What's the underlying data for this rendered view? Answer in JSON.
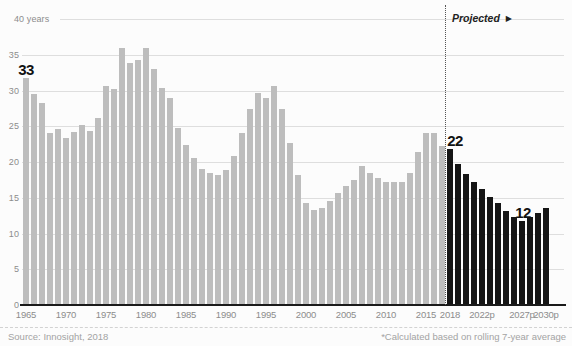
{
  "chart_data": {
    "type": "bar",
    "unit": "years",
    "start_year": 1965,
    "end_year": 2030,
    "values": [
      31.8,
      29.5,
      28.2,
      24.0,
      24.6,
      23.4,
      24.2,
      25.2,
      24.4,
      26.1,
      30.6,
      30.2,
      36.0,
      33.8,
      34.2,
      36.0,
      33.0,
      30.3,
      28.9,
      24.8,
      22.4,
      20.5,
      19.0,
      18.4,
      18.2,
      18.9,
      20.8,
      24.1,
      27.4,
      29.6,
      29.0,
      30.6,
      27.4,
      22.7,
      18.2,
      14.3,
      13.3,
      13.6,
      14.6,
      15.6,
      16.6,
      17.5,
      19.4,
      18.4,
      17.8,
      17.2,
      17.2,
      17.2,
      18.4,
      21.4,
      24.0,
      24.0,
      22.2,
      21.8,
      19.7,
      18.3,
      17.2,
      16.2,
      15.1,
      14.3,
      13.2,
      12.3,
      11.8,
      12.3,
      12.8,
      13.5
    ],
    "projected_from_year": 2018,
    "ylim": [
      0,
      40
    ],
    "yticks": [
      {
        "value": 0,
        "label": "0"
      },
      {
        "value": 5,
        "label": "5"
      },
      {
        "value": 10,
        "label": "10"
      },
      {
        "value": 15,
        "label": "15"
      },
      {
        "value": 20,
        "label": "20"
      },
      {
        "value": 25,
        "label": "25"
      },
      {
        "value": 30,
        "label": "30"
      },
      {
        "value": 35,
        "label": "35"
      },
      {
        "value": 40,
        "label": "40 years"
      }
    ],
    "xticks": [
      {
        "year": 1965,
        "label": "1965"
      },
      {
        "year": 1970,
        "label": "1970"
      },
      {
        "year": 1975,
        "label": "1975"
      },
      {
        "year": 1980,
        "label": "1980"
      },
      {
        "year": 1985,
        "label": "1985"
      },
      {
        "year": 1990,
        "label": "1990"
      },
      {
        "year": 1995,
        "label": "1995"
      },
      {
        "year": 2000,
        "label": "2000"
      },
      {
        "year": 2005,
        "label": "2005"
      },
      {
        "year": 2010,
        "label": "2010"
      },
      {
        "year": 2015,
        "label": "2015"
      },
      {
        "year": 2018,
        "label": "2018"
      },
      {
        "year": 2022,
        "label": "2022p"
      },
      {
        "year": 2027,
        "label": "2027p"
      },
      {
        "year": 2030,
        "label": "2030p"
      }
    ],
    "annotations": [
      {
        "year": 1965,
        "label": "33"
      },
      {
        "year": 2018,
        "label": "22"
      },
      {
        "year": 2027,
        "label": "12"
      }
    ],
    "projected_label": "Projected",
    "projected_arrow": "▶",
    "colors": {
      "historical_bar": "#bdbdbd",
      "projected_bar": "#151515",
      "gridline": "#dedede",
      "axis_line": "#1a1a1a",
      "tick_text": "#8c8c8c",
      "annotation_text": "#121212",
      "projected_text": "#222222",
      "divider_dots": "#555555",
      "footer_text": "#a3a3a3"
    }
  },
  "footer": {
    "source": "Source: Innosight, 2018",
    "note": "*Calculated based on rolling 7-year average"
  }
}
